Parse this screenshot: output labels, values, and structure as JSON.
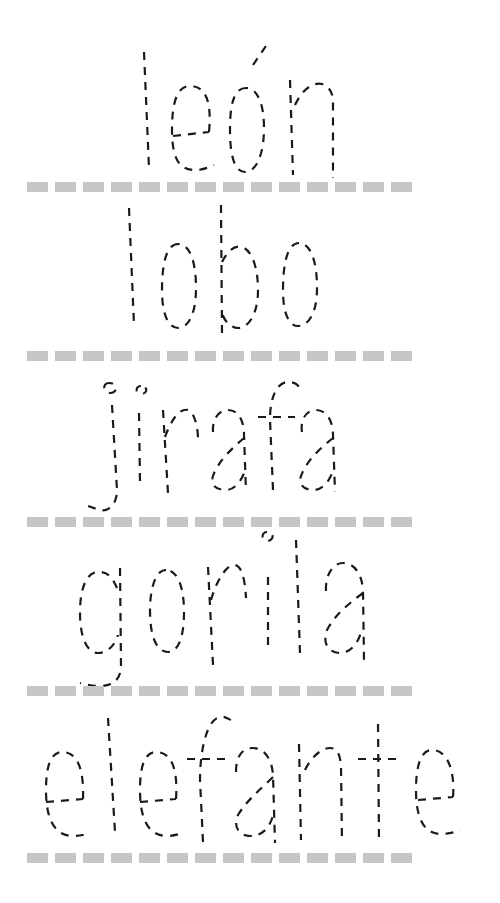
{
  "worksheet": {
    "type": "tracing-practice",
    "words": [
      {
        "text": "león",
        "baseline_y": 182
      },
      {
        "text": "lobo",
        "baseline_y": 351
      },
      {
        "text": "jirafa",
        "baseline_y": 517
      },
      {
        "text": "gorila",
        "baseline_y": 686
      },
      {
        "text": "elefante",
        "baseline_y": 852
      }
    ],
    "baseline_dash_count": 14,
    "colors": {
      "trace_stroke": "#1a1a1a",
      "baseline_dash": "#c6c6c6",
      "background": "#ffffff"
    }
  }
}
